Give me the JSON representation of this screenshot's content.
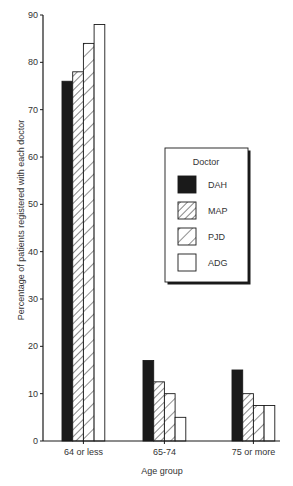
{
  "chart_data": {
    "type": "bar",
    "title": "",
    "xlabel": "Age group",
    "ylabel": "Percentage of patients registered with each doctor",
    "categories": [
      "64 or less",
      "65-74",
      "75 or more"
    ],
    "series": [
      {
        "name": "DAH",
        "fill": "solid",
        "values": [
          76,
          17,
          15
        ]
      },
      {
        "name": "MAP",
        "fill": "dense-hatch",
        "values": [
          78,
          12.5,
          10
        ]
      },
      {
        "name": "PJD",
        "fill": "sparse-hatch",
        "values": [
          84,
          10,
          7.5
        ]
      },
      {
        "name": "ADG",
        "fill": "empty",
        "values": [
          88,
          5,
          7.5
        ]
      }
    ],
    "ylim": [
      0,
      90
    ],
    "yticks": [
      0,
      10,
      20,
      30,
      40,
      50,
      60,
      70,
      80,
      90
    ],
    "grid": false,
    "legend": {
      "title": "Doctor",
      "position": "inside-right",
      "entries": [
        "DAH",
        "MAP",
        "PJD",
        "ADG"
      ]
    }
  },
  "colors": {
    "ink": "#1a1a1a",
    "background": "#ffffff"
  }
}
